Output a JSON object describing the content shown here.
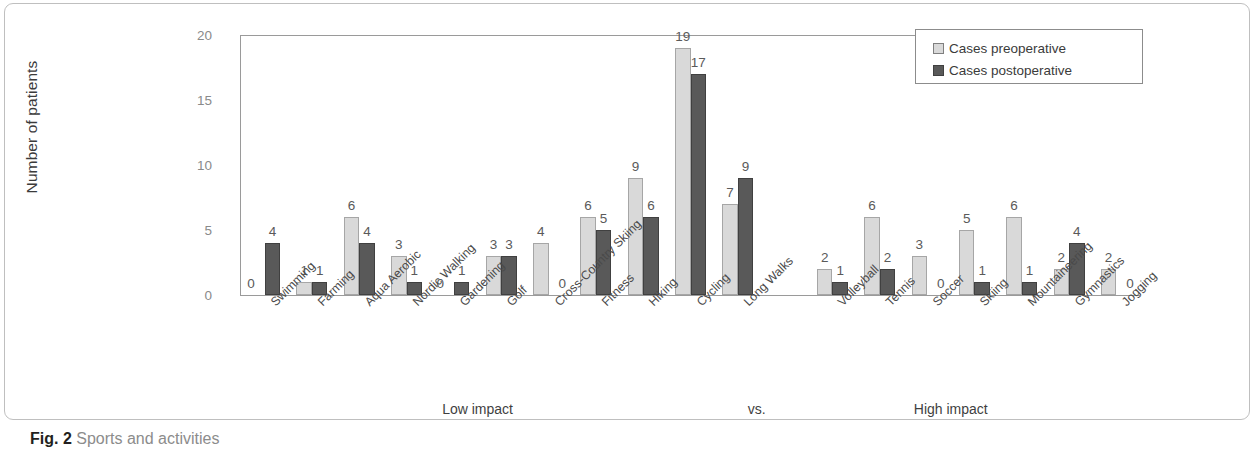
{
  "caption": {
    "prefix": "Fig. 2",
    "text": "Sports and activities"
  },
  "legend": {
    "items": [
      {
        "label": "Cases preoperative",
        "color": "#d9d9d9"
      },
      {
        "label": "Cases postoperative",
        "color": "#595959"
      }
    ]
  },
  "annotations": {
    "low_impact": "Low impact",
    "vs": "vs.",
    "high_impact": "High impact"
  },
  "chart_data": {
    "type": "bar",
    "title": "",
    "xlabel": "",
    "ylabel": "Number of patients",
    "ylim": [
      0,
      20
    ],
    "yticks": [
      0,
      5,
      10,
      15,
      20
    ],
    "grid": false,
    "legend_position": "top-right",
    "categories": [
      "Swimming",
      "Farming",
      "Aqua Aerobic",
      "Nordic Walking",
      "Gardening",
      "Golf",
      "Cross-Country Skiing",
      "Fitness",
      "Hiking",
      "Cycling",
      "Long Walks",
      "Volleyball",
      "Tennis",
      "Soccer",
      "Skiing",
      "Mountaineering",
      "Gymnastics",
      "Jogging"
    ],
    "group_break_after": "Long Walks",
    "groups": [
      {
        "label": "Low impact",
        "categories": [
          "Swimming",
          "Farming",
          "Aqua Aerobic",
          "Nordic Walking",
          "Gardening",
          "Golf",
          "Cross-Country Skiing",
          "Fitness",
          "Hiking",
          "Cycling",
          "Long Walks"
        ]
      },
      {
        "label": "High impact",
        "categories": [
          "Volleyball",
          "Tennis",
          "Soccer",
          "Skiing",
          "Mountaineering",
          "Gymnastics",
          "Jogging"
        ]
      }
    ],
    "series": [
      {
        "name": "Cases preoperative",
        "color": "#d9d9d9",
        "values": [
          0,
          1,
          6,
          3,
          0,
          3,
          4,
          6,
          9,
          19,
          7,
          2,
          6,
          3,
          5,
          6,
          2,
          2
        ]
      },
      {
        "name": "Cases postoperative",
        "color": "#595959",
        "values": [
          4,
          1,
          4,
          1,
          1,
          3,
          0,
          5,
          6,
          17,
          9,
          1,
          2,
          0,
          1,
          1,
          4,
          0
        ]
      }
    ]
  }
}
